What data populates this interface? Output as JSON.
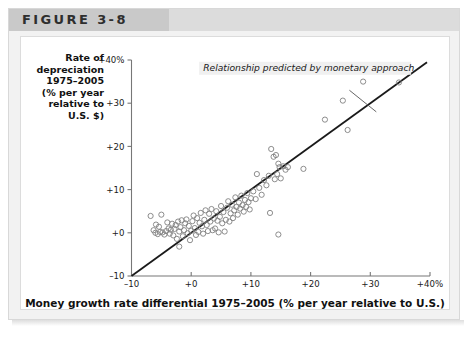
{
  "figure": {
    "label": "FIGURE 3-8"
  },
  "axes": {
    "y_title": "Rate of depreciation 1975–2005 (% per year relative to U.S. $)",
    "y_title_lines": [
      "Rate of",
      "depreciation",
      "1975–2005",
      "(% per year",
      "relative to",
      "U.S. $)"
    ],
    "x_title": "Money growth rate differential 1975–2005 (% per year relative to U.S.)"
  },
  "annotation": {
    "text": "Relationship predicted by monetary approach"
  },
  "chart_data": {
    "type": "scatter",
    "title": "FIGURE 3-8",
    "xlabel": "Money growth rate differential 1975–2005 (% per year relative to U.S.)",
    "ylabel": "Rate of depreciation 1975–2005 (% per year relative to U.S. $)",
    "xlim": [
      -10,
      40
    ],
    "ylim": [
      -10,
      40
    ],
    "xticks": [
      -10,
      0,
      10,
      20,
      30,
      40
    ],
    "yticks": [
      -10,
      0,
      10,
      20,
      30,
      40
    ],
    "xtick_labels": [
      "–10",
      "+0",
      "+10",
      "+20",
      "+30",
      "+40%"
    ],
    "ytick_labels": [
      "–10",
      "+0",
      "+10",
      "+20",
      "+30",
      "+40%"
    ],
    "grid": false,
    "legend": false,
    "annotations": [
      {
        "text": "Relationship predicted by monetary approach",
        "x": 2.0,
        "y": 37.5,
        "leader_from": [
          26.5,
          33.0
        ],
        "leader_to": [
          31.0,
          28.0
        ]
      }
    ],
    "trendline": {
      "label": "Relationship predicted by monetary approach",
      "slope": 1.0,
      "intercept": 0.0,
      "x_start": -10,
      "y_start": -10,
      "x_end": 39.5,
      "y_end": 39.5,
      "color": "#1a1a1a"
    },
    "marker": {
      "shape": "open-circle",
      "color": "#808080",
      "size": 4
    },
    "points": [
      {
        "x": -6.8,
        "y": 3.9
      },
      {
        "x": -5.0,
        "y": 4.2
      },
      {
        "x": -6.3,
        "y": 0.6
      },
      {
        "x": -6.0,
        "y": 0.0
      },
      {
        "x": -5.6,
        "y": -0.3
      },
      {
        "x": -5.2,
        "y": 0.2
      },
      {
        "x": -5.9,
        "y": 1.9
      },
      {
        "x": -5.4,
        "y": 1.4
      },
      {
        "x": -4.8,
        "y": 0.1
      },
      {
        "x": -4.5,
        "y": -0.4
      },
      {
        "x": -4.2,
        "y": 0.4
      },
      {
        "x": -4.0,
        "y": 2.4
      },
      {
        "x": -3.8,
        "y": 1.0
      },
      {
        "x": -3.6,
        "y": -0.2
      },
      {
        "x": -3.4,
        "y": 0.7
      },
      {
        "x": -3.2,
        "y": 2.1
      },
      {
        "x": -3.0,
        "y": -0.6
      },
      {
        "x": -2.8,
        "y": 0.9
      },
      {
        "x": -2.6,
        "y": 1.8
      },
      {
        "x": -2.4,
        "y": -1.4
      },
      {
        "x": -2.2,
        "y": 2.6
      },
      {
        "x": -2.0,
        "y": 0.3
      },
      {
        "x": -2.0,
        "y": -3.2
      },
      {
        "x": -1.8,
        "y": 1.3
      },
      {
        "x": -1.6,
        "y": 2.9
      },
      {
        "x": -1.4,
        "y": -0.8
      },
      {
        "x": -1.2,
        "y": 0.6
      },
      {
        "x": -1.0,
        "y": 2.2
      },
      {
        "x": -0.8,
        "y": 3.1
      },
      {
        "x": -0.6,
        "y": -0.1
      },
      {
        "x": -0.4,
        "y": 1.6
      },
      {
        "x": -0.2,
        "y": -1.7
      },
      {
        "x": 0.0,
        "y": 0.5
      },
      {
        "x": 0.2,
        "y": 2.7
      },
      {
        "x": 0.4,
        "y": 4.0
      },
      {
        "x": 0.6,
        "y": 1.1
      },
      {
        "x": 0.8,
        "y": -0.5
      },
      {
        "x": 1.0,
        "y": 3.4
      },
      {
        "x": 1.2,
        "y": 0.2
      },
      {
        "x": 1.4,
        "y": 2.3
      },
      {
        "x": 1.6,
        "y": 4.6
      },
      {
        "x": 1.8,
        "y": 1.5
      },
      {
        "x": 2.0,
        "y": -0.2
      },
      {
        "x": 2.2,
        "y": 3.0
      },
      {
        "x": 2.4,
        "y": 5.2
      },
      {
        "x": 2.6,
        "y": 1.8
      },
      {
        "x": 2.8,
        "y": 0.4
      },
      {
        "x": 3.0,
        "y": 4.4
      },
      {
        "x": 3.2,
        "y": 2.6
      },
      {
        "x": 3.4,
        "y": 5.5
      },
      {
        "x": 3.6,
        "y": 0.6
      },
      {
        "x": 3.8,
        "y": 3.3
      },
      {
        "x": 4.0,
        "y": 1.0
      },
      {
        "x": 4.2,
        "y": 5.0
      },
      {
        "x": 4.4,
        "y": 2.8
      },
      {
        "x": 4.6,
        "y": 0.1
      },
      {
        "x": 4.8,
        "y": 3.7
      },
      {
        "x": 5.0,
        "y": 6.2
      },
      {
        "x": 5.2,
        "y": 2.2
      },
      {
        "x": 5.4,
        "y": 4.8
      },
      {
        "x": 5.6,
        "y": 0.3
      },
      {
        "x": 5.8,
        "y": 3.0
      },
      {
        "x": 6.0,
        "y": 5.8
      },
      {
        "x": 6.2,
        "y": 7.3
      },
      {
        "x": 6.4,
        "y": 2.6
      },
      {
        "x": 6.6,
        "y": 4.5
      },
      {
        "x": 6.8,
        "y": 6.5
      },
      {
        "x": 7.0,
        "y": 3.4
      },
      {
        "x": 7.2,
        "y": 5.2
      },
      {
        "x": 7.4,
        "y": 8.2
      },
      {
        "x": 7.6,
        "y": 6.0
      },
      {
        "x": 7.8,
        "y": 4.2
      },
      {
        "x": 8.0,
        "y": 7.0
      },
      {
        "x": 8.2,
        "y": 5.6
      },
      {
        "x": 8.4,
        "y": 8.6
      },
      {
        "x": 8.6,
        "y": 6.4
      },
      {
        "x": 8.8,
        "y": 4.9
      },
      {
        "x": 9.0,
        "y": 7.6
      },
      {
        "x": 9.2,
        "y": 6.0
      },
      {
        "x": 9.4,
        "y": 9.2
      },
      {
        "x": 9.6,
        "y": 7.1
      },
      {
        "x": 9.8,
        "y": 5.4
      },
      {
        "x": 10.0,
        "y": 8.0
      },
      {
        "x": 10.4,
        "y": 9.6
      },
      {
        "x": 10.8,
        "y": 7.8
      },
      {
        "x": 11.0,
        "y": 13.6
      },
      {
        "x": 11.4,
        "y": 10.4
      },
      {
        "x": 11.8,
        "y": 8.8
      },
      {
        "x": 12.2,
        "y": 12.2
      },
      {
        "x": 12.6,
        "y": 11.0
      },
      {
        "x": 13.0,
        "y": 13.2
      },
      {
        "x": 13.4,
        "y": 19.4
      },
      {
        "x": 13.8,
        "y": 17.6
      },
      {
        "x": 14.0,
        "y": 12.4
      },
      {
        "x": 14.2,
        "y": 18.0
      },
      {
        "x": 14.4,
        "y": 13.6
      },
      {
        "x": 14.6,
        "y": 16.0
      },
      {
        "x": 14.8,
        "y": 15.2
      },
      {
        "x": 15.0,
        "y": 12.6
      },
      {
        "x": 15.4,
        "y": 15.4
      },
      {
        "x": 15.8,
        "y": 14.6
      },
      {
        "x": 16.2,
        "y": 15.2
      },
      {
        "x": 13.2,
        "y": 4.6
      },
      {
        "x": 14.6,
        "y": -0.4
      },
      {
        "x": 18.8,
        "y": 14.8
      },
      {
        "x": 22.4,
        "y": 26.2
      },
      {
        "x": 25.4,
        "y": 30.6
      },
      {
        "x": 26.2,
        "y": 23.8
      },
      {
        "x": 28.8,
        "y": 35.0
      },
      {
        "x": 34.8,
        "y": 34.8
      }
    ]
  }
}
